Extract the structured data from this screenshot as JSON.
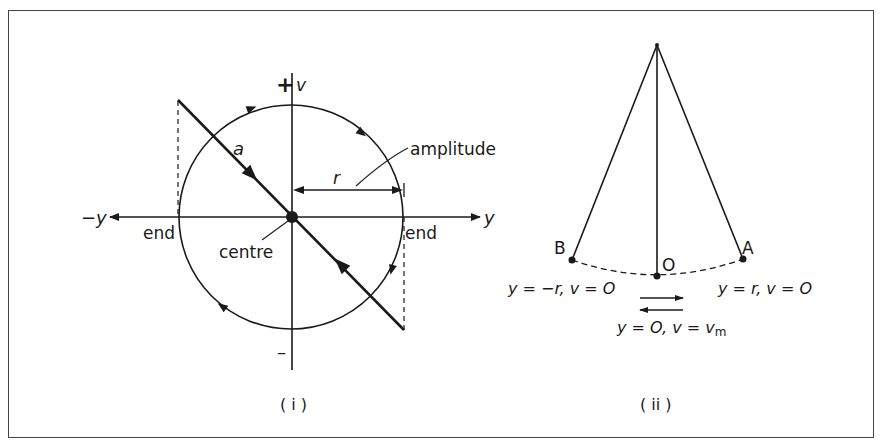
{
  "figure": {
    "panel_i": {
      "caption": "( i )",
      "axis_labels": {
        "v_axis": "v",
        "v_positive": "+",
        "v_negative": "–",
        "y_positive": "y",
        "y_negative": "−y"
      },
      "labels": {
        "acceleration": "a",
        "radius": "r",
        "amplitude": "amplitude",
        "centre": "centre",
        "end_left": "end",
        "end_right": "end"
      }
    },
    "panel_ii": {
      "caption": "( ii )",
      "points": {
        "B": "B",
        "O": "O",
        "A": "A"
      },
      "conditions": {
        "at_B": "y = −r, v = O",
        "at_A": "y = r, v = O",
        "at_O_prefix": "y = O, v = v",
        "at_O_subscript": "m"
      }
    }
  },
  "colors": {
    "ink": "#1a1a1a",
    "border": "#444444",
    "background": "#ffffff"
  }
}
